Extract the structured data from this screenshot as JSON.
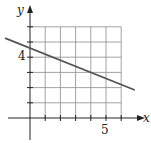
{
  "chart_data": {
    "type": "line",
    "title": "",
    "xlabel": "x",
    "ylabel": "y",
    "xlim": [
      -2,
      7.5
    ],
    "ylim": [
      -1.5,
      7
    ],
    "grid": true,
    "grid_range": {
      "x": [
        0,
        6
      ],
      "y": [
        0,
        6
      ]
    },
    "tick_labels": {
      "x": [
        {
          "value": 5,
          "label": "5"
        }
      ],
      "y": [
        {
          "value": 4,
          "label": "4"
        }
      ]
    },
    "series": [
      {
        "name": "line",
        "equation": "y = -0.4x + 4.6",
        "x": [
          -1.6,
          6.85
        ],
        "y": [
          5.24,
          1.86
        ],
        "color": "#555555"
      }
    ],
    "legend": null
  },
  "axes": {
    "x_label": "x",
    "y_label": "y",
    "x_tick_label": "5",
    "y_tick_label": "4"
  },
  "colors": {
    "grid": "#8a8a8a",
    "axis": "#222222",
    "line": "#555555"
  }
}
